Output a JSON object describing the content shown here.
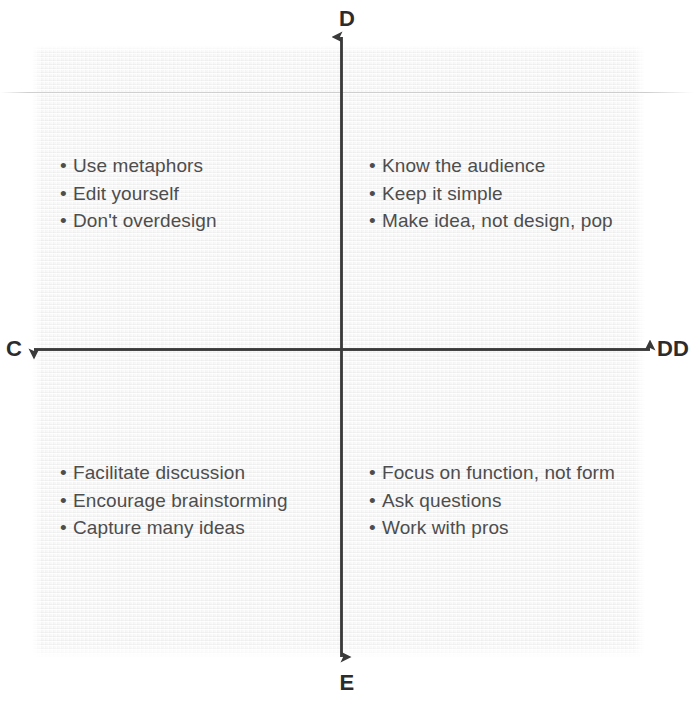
{
  "diagram": {
    "background_color": "#f4f4f4",
    "axis_color": "#3a3a3a",
    "text_color": "#4d4d4d",
    "label_color": "#2c2c2c"
  },
  "axes": {
    "top_label": "D",
    "bottom_label": "E",
    "left_label": "C",
    "right_label": "DD"
  },
  "quadrants": {
    "top_left": {
      "name": "top-left-quadrant",
      "items": [
        "Use metaphors",
        "Edit yourself",
        "Don't overdesign"
      ]
    },
    "top_right": {
      "name": "top-right-quadrant",
      "items": [
        "Know the audience",
        "Keep it simple",
        "Make idea, not design, pop"
      ]
    },
    "bottom_left": {
      "name": "bottom-left-quadrant",
      "items": [
        "Facilitate discussion",
        "Encourage brainstorming",
        "Capture many ideas"
      ]
    },
    "bottom_right": {
      "name": "bottom-right-quadrant",
      "items": [
        "Focus on function, not form",
        "Ask questions",
        "Work with pros"
      ]
    }
  },
  "bullet_glyph": "•"
}
